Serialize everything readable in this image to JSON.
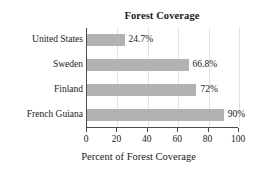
{
  "chart_data": {
    "type": "bar",
    "orientation": "horizontal",
    "title": "Forest Coverage",
    "xlabel": "Percent of Forest Coverage",
    "ylabel": "",
    "categories": [
      "United States",
      "Sweden",
      "Finland",
      "French Guiana"
    ],
    "values": [
      24.7,
      66.8,
      72,
      90
    ],
    "value_labels": [
      "24.7%",
      "66.8%",
      "72%",
      "90%"
    ],
    "xlim": [
      0,
      100
    ],
    "xticks": [
      0,
      20,
      40,
      60,
      80,
      100
    ],
    "xtick_labels": [
      "0",
      "20",
      "40",
      "60",
      "80",
      "100"
    ],
    "grid": "vertical-light",
    "legend": "none",
    "bar_color": "#b2b2b2",
    "axis_color": "#4a4a4a",
    "gridline_color": "#e2e2e2",
    "text_color": "#1a1a1a",
    "background": "#ffffff"
  }
}
